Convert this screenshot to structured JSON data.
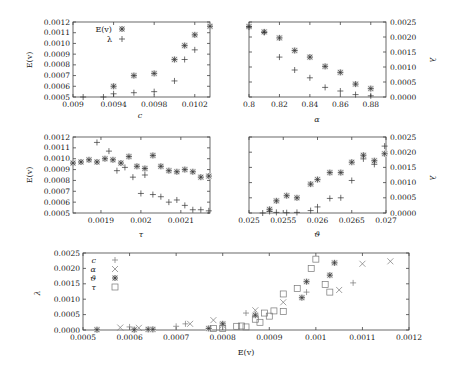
{
  "chart_data": [
    {
      "type": "scatter",
      "panel": "top-left",
      "xlabel": "c",
      "ylabel_left": "E(v)",
      "xlim": [
        0.009,
        0.01035
      ],
      "ylim": [
        0.0005,
        0.0012
      ],
      "xticks": [
        "0.009",
        "0.0094",
        "0.0098",
        "0.0102"
      ],
      "yticks": [
        "0.0005",
        "0.0006",
        "0.0007",
        "0.0008",
        "0.0009",
        "0.0010",
        "0.0011",
        "0.0012"
      ],
      "legend": [
        {
          "label": "E(v)",
          "marker": "star"
        },
        {
          "label": "λ",
          "marker": "plus"
        }
      ],
      "series": [
        {
          "name": "E(v)",
          "marker": "star",
          "x": [
            0.0094,
            0.0096,
            0.0098,
            0.01,
            0.0101,
            0.0102,
            0.01035
          ],
          "y": [
            0.0006,
            0.0007,
            0.00072,
            0.00085,
            0.00098,
            0.00108,
            0.00116
          ]
        },
        {
          "name": "λ",
          "marker": "plus",
          "x": [
            0.0091,
            0.0093,
            0.0094,
            0.0096,
            0.0098,
            0.01,
            0.0101,
            0.0102
          ],
          "y": [
            0.0005,
            0.0005,
            0.00053,
            0.00054,
            0.00055,
            0.00065,
            0.00085,
            0.00094
          ]
        }
      ]
    },
    {
      "type": "scatter",
      "panel": "top-right",
      "xlabel": "α",
      "ylabel_right": "λ",
      "xlim": [
        0.8,
        0.89
      ],
      "ylim": [
        0,
        0.0025
      ],
      "xticks": [
        "0.8",
        "0.82",
        "0.84",
        "0.86",
        "0.88"
      ],
      "yticks": [
        "0.0000",
        "0.0005",
        "0.0010",
        "0.0015",
        "0.0020",
        "0.0025"
      ],
      "series": [
        {
          "name": "E(v)",
          "marker": "star",
          "x": [
            0.8,
            0.81,
            0.82,
            0.83,
            0.84,
            0.85,
            0.86,
            0.87,
            0.88
          ],
          "y": [
            0.00235,
            0.00217,
            0.00197,
            0.00155,
            0.00133,
            0.00102,
            0.00082,
            0.00043,
            0.00028
          ]
        },
        {
          "name": "λ",
          "marker": "plus",
          "x": [
            0.8,
            0.81,
            0.82,
            0.83,
            0.84,
            0.85,
            0.86,
            0.87,
            0.88
          ],
          "y": [
            0.00233,
            0.00215,
            0.00133,
            0.0009,
            0.00064,
            0.00032,
            0.0002,
            8e-05,
            4e-05
          ]
        }
      ]
    },
    {
      "type": "scatter",
      "panel": "middle-left",
      "xlabel": "τ",
      "ylabel_left": "E(v)",
      "xlim": [
        0.00183,
        0.002173
      ],
      "ylim": [
        0.0005,
        0.0012
      ],
      "xticks": [
        "0.0019",
        "0.002",
        "0.0021"
      ],
      "yticks": [
        "0.0005",
        "0.0006",
        "0.0007",
        "0.0008",
        "0.0009",
        "0.0010",
        "0.0011",
        "0.0012"
      ],
      "series": [
        {
          "name": "E(v)",
          "marker": "star",
          "x": [
            0.00183,
            0.00185,
            0.00187,
            0.00189,
            0.00191,
            0.00193,
            0.00195,
            0.00197,
            0.00199,
            0.00201,
            0.00203,
            0.00205,
            0.00207,
            0.00209,
            0.00211,
            0.00213,
            0.00215,
            0.00217
          ],
          "y": [
            0.00096,
            0.00097,
            0.00099,
            0.00097,
            0.001,
            0.00099,
            0.00096,
            0.00102,
            0.00093,
            0.00091,
            0.00103,
            0.00093,
            0.00089,
            0.00088,
            0.0009,
            0.00088,
            0.00083,
            0.00084,
            0.00078,
            0.00085,
            0.0008
          ]
        },
        {
          "name": "λ",
          "marker": "plus",
          "x": [
            0.00189,
            0.00192,
            0.00194,
            0.00196,
            0.00198,
            0.002,
            0.00201,
            0.00203,
            0.00205,
            0.00207,
            0.00209,
            0.00211,
            0.00213,
            0.00215,
            0.00217
          ],
          "y": [
            0.00115,
            0.00107,
            0.00089,
            0.00092,
            0.00083,
            0.00068,
            0.00085,
            0.00067,
            0.00065,
            0.0006,
            0.00062,
            0.00057,
            0.00053,
            0.00053,
            0.00052
          ]
        }
      ]
    },
    {
      "type": "scatter",
      "panel": "middle-right",
      "xlabel": "ϑ",
      "ylabel_right": "λ",
      "xlim": [
        0.025,
        0.027
      ],
      "ylim": [
        0,
        0.0025
      ],
      "xticks": [
        "0.025",
        "0.0255",
        "0.026",
        "0.0265",
        "0.027"
      ],
      "yticks": [
        "0.0000",
        "0.0005",
        "0.0010",
        "0.0015",
        "0.0020",
        "0.0025"
      ],
      "series": [
        {
          "name": "E(v)",
          "marker": "star",
          "x": [
            0.0253,
            0.0254,
            0.02555,
            0.0257,
            0.0259,
            0.026,
            0.02618,
            0.02634,
            0.0265,
            0.02667,
            0.02683,
            0.02698
          ],
          "y": [
            0.00012,
            0.0004,
            0.00057,
            0.0005,
            0.00095,
            0.0011,
            0.00133,
            0.00133,
            0.00167,
            0.0019,
            0.00172,
            0.00195
          ]
        },
        {
          "name": "λ",
          "marker": "plus",
          "x": [
            0.0252,
            0.0253,
            0.0254,
            0.02555,
            0.0257,
            0.0259,
            0.026,
            0.02618,
            0.02634,
            0.0265,
            0.02667,
            0.02683,
            0.02698
          ],
          "y": [
            0.0,
            5e-05,
            2e-05,
            1e-05,
            2e-05,
            8e-05,
            0.0002,
            0.00048,
            0.0005,
            0.00107,
            0.00178,
            0.0016,
            0.0022
          ]
        }
      ]
    },
    {
      "type": "scatter",
      "panel": "bottom",
      "xlabel": "E(v)",
      "ylabel_left": "λ",
      "xlim": [
        0.0005,
        0.0012
      ],
      "ylim": [
        0,
        0.0025
      ],
      "xticks": [
        "0.0005",
        "0.0006",
        "0.0007",
        "0.0008",
        "0.0009",
        "0.001",
        "0.0011",
        "0.0012"
      ],
      "yticks": [
        "0.0000",
        "0.0005",
        "0.0010",
        "0.0015",
        "0.0020",
        "0.0025"
      ],
      "legend": [
        {
          "label": "c",
          "marker": "plus"
        },
        {
          "label": "α",
          "marker": "cross"
        },
        {
          "label": "ϑ",
          "marker": "star"
        },
        {
          "label": "τ",
          "marker": "square"
        }
      ],
      "series": [
        {
          "name": "c",
          "marker": "plus",
          "x": [
            0.0006,
            0.0007,
            0.00072,
            0.00085,
            0.00087,
            0.00098,
            0.00108
          ],
          "y": [
            0.0001,
            0.00012,
            0.0002,
            0.00055,
            0.0005,
            0.00123,
            0.00153
          ]
        },
        {
          "name": "α",
          "marker": "cross",
          "x": [
            0.00058,
            0.00062,
            0.00073,
            0.00078,
            0.0008,
            0.00087,
            0.00093,
            0.00105,
            0.0011,
            0.00116
          ],
          "y": [
            8e-05,
            7e-05,
            0.0002,
            0.00032,
            0.00015,
            0.00064,
            0.0009,
            0.0013,
            0.00215,
            0.00223
          ]
        },
        {
          "name": "ϑ",
          "marker": "star",
          "x": [
            0.00053,
            0.00061,
            0.00064,
            0.00065,
            0.00077,
            0.0008,
            0.00087,
            0.00097,
            0.00098,
            0.00103,
            0.00104
          ],
          "y": [
            1e-05,
            1e-05,
            2e-05,
            2e-05,
            5e-05,
            0.0002,
            0.00048,
            0.00105,
            0.00157,
            0.00178,
            0.00218
          ]
        },
        {
          "name": "τ",
          "marker": "square",
          "x": [
            0.00078,
            0.0008,
            0.00083,
            0.00084,
            0.00085,
            0.00087,
            0.00088,
            0.00089,
            0.0009,
            0.00091,
            0.00093,
            0.00093,
            0.00096,
            0.00099,
            0.001,
            0.00102,
            0.00103
          ],
          "y": [
            5e-05,
            5e-05,
            0.00012,
            0.00013,
            0.0001,
            0.00035,
            0.00025,
            0.00055,
            0.00045,
            0.00062,
            0.0006,
            0.00117,
            0.00135,
            0.002,
            0.0023,
            0.00148,
            0.00123
          ]
        }
      ]
    }
  ],
  "panels": {
    "p1": {
      "xlabel": "c",
      "ylabel": "E(v)",
      "legend_ev": "E(v)",
      "legend_lambda": "λ"
    },
    "p2": {
      "xlabel": "α",
      "ylabel": "λ"
    },
    "p3": {
      "xlabel": "τ",
      "ylabel": "E(v)"
    },
    "p4": {
      "xlabel": "ϑ",
      "ylabel": "λ"
    },
    "p5": {
      "xlabel": "E(v)",
      "ylabel": "λ",
      "legend": [
        "c",
        "α",
        "ϑ",
        "τ"
      ]
    }
  }
}
